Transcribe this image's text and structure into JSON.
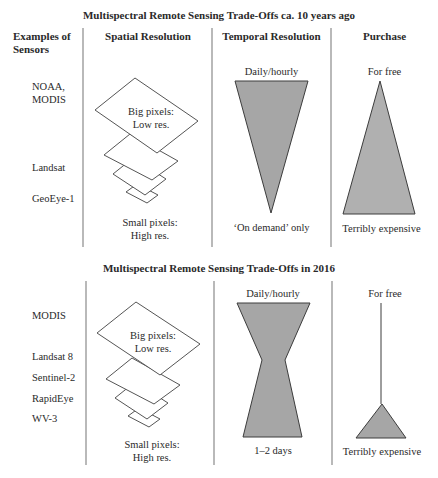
{
  "section1": {
    "title": "Multispectral Remote Sensing Trade-Offs ca. 10 years ago",
    "headers": {
      "sensors": "Examples of Sensors",
      "sensors_line1": "Examples of",
      "sensors_line2": "Sensors",
      "spatial": "Spatial Resolution",
      "temporal": "Temporal Resolution",
      "purchase": "Purchase"
    },
    "sensors": [
      "NOAA,",
      "MODIS",
      "Landsat",
      "GeoEye-1"
    ],
    "spatial": {
      "big_line1": "Big pixels:",
      "big_line2": "Low res.",
      "small_line1": "Small pixels:",
      "small_line2": "High res."
    },
    "temporal": {
      "top": "Daily/hourly",
      "bottom": "‘On demand’ only"
    },
    "purchase": {
      "top": "For free",
      "bottom": "Terribly expensive"
    }
  },
  "section2": {
    "title": "Multispectral Remote Sensing Trade-Offs in 2016",
    "sensors": [
      "MODIS",
      "Landsat 8",
      "Sentinel-2",
      "RapidEye",
      "WV-3"
    ],
    "spatial": {
      "big_line1": "Big pixels:",
      "big_line2": "Low res.",
      "small_line1": "Small pixels:",
      "small_line2": "High res."
    },
    "temporal": {
      "top": "Daily/hourly",
      "bottom": "1–2 days"
    },
    "purchase": {
      "top": "For free",
      "bottom": "Terribly expensive"
    }
  },
  "colors": {
    "shape_fill": "#a6a6a6",
    "shape_stroke": "#3c3c3c",
    "divider": "#8a8a8a",
    "text": "#2a2a2a"
  }
}
